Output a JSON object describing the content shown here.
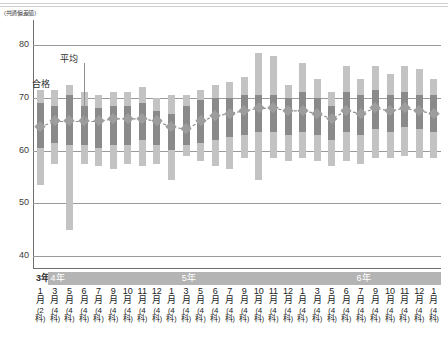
{
  "axis_unit_label": "(共通偏差値)",
  "annotations": [
    {
      "name": "pass-label",
      "text": "合格"
    },
    {
      "name": "average-label",
      "text": "平均"
    }
  ],
  "colors": {
    "range_bar": "#c3c3c3",
    "core_bar": "#8a8a8a",
    "marker": "#9d9d9d",
    "gridline": "#9a9a9a",
    "axis": "#6e6e6e",
    "year_band": "#b4b4b4"
  },
  "year_bands": [
    {
      "label": "3年",
      "start": 0,
      "end": 1
    },
    {
      "label": "4年",
      "start": 1,
      "end": 10
    },
    {
      "label": "5年",
      "start": 10,
      "end": 22
    },
    {
      "label": "6年",
      "start": 22,
      "end": 28
    }
  ],
  "chart_data": {
    "type": "bar",
    "title": "",
    "xlabel": "",
    "ylabel": "(共通偏差値)",
    "ylim": [
      36,
      82
    ],
    "yticks": [
      40,
      50,
      60,
      70,
      80
    ],
    "grid": true,
    "legend_position": "inline-annotation",
    "categories": [
      "3年1月(2科)",
      "4年3月(4科)",
      "4年5月(4科)",
      "4年6月(4科)",
      "4年7月(4科)",
      "4年9月(4科)",
      "4年10月(4科)",
      "4年11月(4科)",
      "4年12月(4科)",
      "5年1月(4科)",
      "5年3月(4科)",
      "5年5月(4科)",
      "5年6月(4科)",
      "5年7月(4科)",
      "5年9月(4科)",
      "5年10月(4科)",
      "5年11月(4科)",
      "5年12月(4科)",
      "6年1月(4科)",
      "6年3月(4科)",
      "6年5月(4科)",
      "6年6月(4科)",
      "6年7月(4科)",
      "6年9月(4科)",
      "6年10月(4科)",
      "6年11月(4科)",
      "6年12月(4科)",
      "6年1月(4科)"
    ],
    "month_labels": [
      {
        "month": "1",
        "subjects": "2"
      },
      {
        "month": "3",
        "subjects": "4"
      },
      {
        "month": "5",
        "subjects": "4"
      },
      {
        "month": "6",
        "subjects": "4"
      },
      {
        "month": "7",
        "subjects": "4"
      },
      {
        "month": "9",
        "subjects": "4"
      },
      {
        "month": "10",
        "subjects": "4"
      },
      {
        "month": "11",
        "subjects": "4"
      },
      {
        "month": "12",
        "subjects": "4"
      },
      {
        "month": "1",
        "subjects": "4"
      },
      {
        "month": "3",
        "subjects": "4"
      },
      {
        "month": "5",
        "subjects": "4"
      },
      {
        "month": "6",
        "subjects": "4"
      },
      {
        "month": "7",
        "subjects": "4"
      },
      {
        "month": "9",
        "subjects": "4"
      },
      {
        "month": "10",
        "subjects": "4"
      },
      {
        "month": "11",
        "subjects": "4"
      },
      {
        "month": "12",
        "subjects": "4"
      },
      {
        "month": "1",
        "subjects": "4"
      },
      {
        "month": "3",
        "subjects": "4"
      },
      {
        "month": "5",
        "subjects": "4"
      },
      {
        "month": "6",
        "subjects": "4"
      },
      {
        "month": "7",
        "subjects": "4"
      },
      {
        "month": "9",
        "subjects": "4"
      },
      {
        "month": "10",
        "subjects": "4"
      },
      {
        "month": "11",
        "subjects": "4"
      },
      {
        "month": "12",
        "subjects": "4"
      },
      {
        "month": "1",
        "subjects": "4"
      },
      {
        "month": "3",
        "subjects": "4"
      },
      {
        "month": "5",
        "subjects": "4"
      },
      {
        "month": "6",
        "subjects": "4"
      }
    ],
    "month_unit": "月",
    "subject_unit": "科",
    "series": [
      {
        "name": "範囲 (range)",
        "key": "range_high",
        "values": [
          71.5,
          71.5,
          72.5,
          71.0,
          70.5,
          71.0,
          71.0,
          72.0,
          70.0,
          70.5,
          70.5,
          71.5,
          72.5,
          73.0,
          74.0,
          78.5,
          78.0,
          72.5,
          76.5,
          73.5,
          71.0,
          76.0,
          73.5,
          76.0,
          74.5,
          76.0,
          75.5,
          73.5
        ]
      },
      {
        "name": "範囲 (range)",
        "key": "range_low",
        "values": [
          53.5,
          57.5,
          45.0,
          57.5,
          57.0,
          56.5,
          57.5,
          57.0,
          57.5,
          54.5,
          59.0,
          58.0,
          57.0,
          56.5,
          58.5,
          54.5,
          58.5,
          58.0,
          58.5,
          58.0,
          57.0,
          58.0,
          57.5,
          58.5,
          58.5,
          59.0,
          58.5,
          58.5
        ]
      },
      {
        "name": "合格帯 (core high)",
        "key": "core_high",
        "values": [
          69.0,
          68.5,
          70.5,
          68.5,
          68.0,
          68.5,
          68.5,
          69.0,
          67.5,
          67.0,
          68.5,
          69.5,
          70.0,
          70.0,
          70.5,
          70.5,
          70.5,
          70.0,
          71.0,
          70.0,
          68.5,
          71.0,
          70.5,
          71.5,
          70.5,
          71.0,
          70.5,
          70.5
        ]
      },
      {
        "name": "合格帯 (core low)",
        "key": "core_low",
        "values": [
          60.5,
          61.5,
          61.0,
          61.0,
          60.5,
          61.0,
          61.0,
          62.0,
          61.0,
          60.0,
          61.0,
          61.5,
          62.0,
          62.5,
          63.0,
          63.5,
          63.5,
          63.0,
          63.5,
          63.0,
          62.0,
          63.5,
          63.0,
          64.0,
          63.5,
          64.5,
          64.0,
          63.5
        ]
      },
      {
        "name": "平均",
        "key": "average",
        "values": [
          64.5,
          65.5,
          65.5,
          65.5,
          65.5,
          66.0,
          66.0,
          66.0,
          65.5,
          64.5,
          64.0,
          65.5,
          66.5,
          67.0,
          67.5,
          68.0,
          68.0,
          67.5,
          67.5,
          67.0,
          66.0,
          67.5,
          67.0,
          68.0,
          67.5,
          68.0,
          67.5,
          67.0
        ]
      }
    ]
  }
}
